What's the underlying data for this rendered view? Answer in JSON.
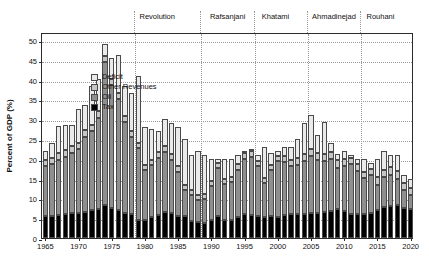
{
  "chart_data": {
    "type": "bar",
    "stacked": true,
    "title": "",
    "xlabel": "",
    "ylabel": "Percent of GDP (%)",
    "ylim": [
      0,
      52
    ],
    "yticks": [
      0,
      5,
      10,
      15,
      20,
      25,
      30,
      35,
      40,
      45,
      50
    ],
    "xlim": [
      1964.5,
      2020.5
    ],
    "xticks": [
      1965,
      1970,
      1975,
      1980,
      1985,
      1990,
      1995,
      2000,
      2005,
      2010,
      2015,
      2020
    ],
    "grid": "horizontal-dotted",
    "legend_position": "upper-left-inside",
    "series": [
      {
        "name": "Tax",
        "color": "#000000",
        "order": 1
      },
      {
        "name": "Oil",
        "color": "#8f8f8f",
        "order": 2
      },
      {
        "name": "Other Revenues",
        "color": "#c6c6c6",
        "order": 3
      },
      {
        "name": "Deficit",
        "color": "#eaeaea",
        "order": 4
      }
    ],
    "categories": [
      1965,
      1966,
      1967,
      1968,
      1969,
      1970,
      1971,
      1972,
      1973,
      1974,
      1975,
      1976,
      1977,
      1978,
      1979,
      1980,
      1981,
      1982,
      1983,
      1984,
      1985,
      1986,
      1987,
      1988,
      1989,
      1990,
      1991,
      1992,
      1993,
      1994,
      1995,
      1996,
      1997,
      1998,
      1999,
      2000,
      2001,
      2002,
      2003,
      2004,
      2005,
      2006,
      2007,
      2008,
      2009,
      2010,
      2011,
      2012,
      2013,
      2014,
      2015,
      2016,
      2017,
      2018,
      2019,
      2020
    ],
    "values": {
      "Tax": [
        5.5,
        5.6,
        5.8,
        6.0,
        6.2,
        6.3,
        6.6,
        7.0,
        7.4,
        8.3,
        7.6,
        7.0,
        6.3,
        6.0,
        4.6,
        4.6,
        5.4,
        5.8,
        6.6,
        6.3,
        5.6,
        5.5,
        4.4,
        4.0,
        3.9,
        4.6,
        5.6,
        4.6,
        4.6,
        5.2,
        6.0,
        5.9,
        5.6,
        5.3,
        5.6,
        5.4,
        5.8,
        6.1,
        6.0,
        6.0,
        6.3,
        6.3,
        6.5,
        6.9,
        7.3,
        6.8,
        6.1,
        6.0,
        6.1,
        6.3,
        7.0,
        7.8,
        8.0,
        8.3,
        7.6,
        7.3
      ],
      "Oil": [
        12.8,
        13.2,
        14.0,
        14.5,
        15.2,
        16.2,
        19.0,
        20.0,
        23.0,
        36.2,
        31.0,
        28.0,
        23.0,
        19.5,
        18.0,
        12.5,
        13.0,
        14.5,
        15.0,
        13.5,
        11.0,
        6.5,
        6.5,
        5.5,
        6.0,
        8.5,
        12.0,
        9.0,
        9.5,
        12.0,
        14.0,
        14.5,
        12.5,
        8.5,
        11.5,
        14.0,
        13.5,
        12.0,
        12.5,
        13.5,
        14.5,
        13.5,
        13.0,
        13.0,
        10.5,
        11.5,
        12.5,
        11.0,
        9.0,
        9.5,
        6.5,
        7.5,
        8.0,
        6.5,
        4.5,
        3.5
      ],
      "Other Revenues": [
        1.5,
        1.5,
        1.6,
        1.7,
        1.8,
        1.6,
        1.7,
        1.6,
        1.7,
        1.5,
        1.5,
        1.6,
        1.6,
        1.6,
        1.5,
        1.3,
        1.4,
        1.5,
        1.6,
        1.5,
        1.5,
        1.3,
        1.3,
        1.4,
        1.3,
        1.3,
        1.4,
        1.3,
        1.3,
        1.4,
        1.5,
        1.5,
        1.4,
        1.3,
        1.4,
        1.4,
        1.5,
        1.6,
        1.6,
        1.6,
        1.7,
        1.7,
        1.7,
        1.8,
        1.8,
        1.7,
        1.6,
        1.6,
        1.6,
        1.7,
        1.8,
        1.9,
        1.9,
        2.0,
        1.8,
        1.7
      ],
      "Deficit": [
        2.2,
        3.7,
        6.9,
        6.3,
        5.3,
        8.4,
        6.2,
        9.8,
        8.0,
        3.1,
        5.4,
        9.5,
        7.5,
        9.4,
        16.9,
        9.6,
        7.8,
        5.2,
        6.8,
        7.7,
        9.9,
        11.7,
        8.8,
        11.1,
        9.8,
        5.6,
        1.0,
        5.1,
        4.6,
        2.4,
        0.5,
        0.1,
        1.5,
        7.9,
        3.0,
        1.2,
        2.2,
        3.3,
        4.9,
        7.9,
        8.5,
        4.5,
        8.0,
        2.3,
        1.7,
        2.0,
        0.8,
        1.4,
        3.3,
        1.5,
        4.7,
        4.8,
        3.1,
        4.2,
        2.1,
        2.5
      ]
    }
  },
  "eras": [
    {
      "label": "Revolution",
      "start": 1979,
      "label_x": 1982.0
    },
    {
      "label": "Rafsanjani",
      "start": 1989,
      "label_x": 1992.6
    },
    {
      "label": "Khatami",
      "start": 1997,
      "label_x": 1999.8
    },
    {
      "label": "Ahmadinejad",
      "start": 2005,
      "label_x": 2008.6
    },
    {
      "label": "Rouhani",
      "start": 2013,
      "label_x": 2015.6
    }
  ]
}
